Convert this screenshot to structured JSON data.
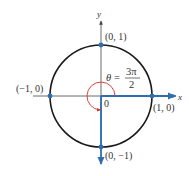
{
  "diagram": {
    "axes": {
      "x_label": "x",
      "y_label": "y",
      "origin_label": "0"
    },
    "points": [
      {
        "id": "top",
        "label": "(0, 1)"
      },
      {
        "id": "left",
        "label": "(−1, 0)"
      },
      {
        "id": "right",
        "label": "(1, 0)"
      },
      {
        "id": "bottom",
        "label": "(0, −1)"
      }
    ],
    "angle": {
      "symbol": "θ",
      "equals": "=",
      "numerator": "3π",
      "denominator": "2",
      "value_text": "θ = 3π/2"
    },
    "colors": {
      "circle": "#1a1a1a",
      "axis": "#444444",
      "ray": "#2f6db5",
      "point": "#2f6db5",
      "angle_arc": "#d9302c",
      "text": "#333333"
    }
  }
}
